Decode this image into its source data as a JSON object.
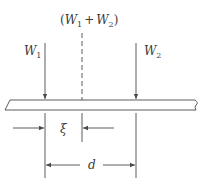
{
  "diagram": {
    "type": "beam-load-resultant",
    "labels": {
      "resultant": {
        "open": "(",
        "w1": "W",
        "w1_sub": "1",
        "plus": "+",
        "w2": "W",
        "w2_sub": "2",
        "close": ")"
      },
      "load1": {
        "main": "W",
        "sub": "1"
      },
      "load2": {
        "main": "W",
        "sub": "2"
      },
      "offset": "ξ",
      "spacing": "d"
    },
    "colors": {
      "line": "#4a4a4a",
      "text": "#3a3a3a",
      "background": "#ffffff"
    }
  }
}
